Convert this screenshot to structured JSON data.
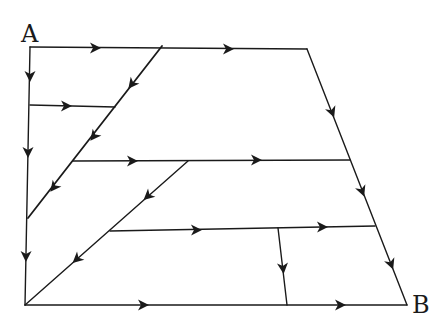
{
  "diagram": {
    "title": "",
    "nodes": {
      "source": {
        "label": "A"
      },
      "sink": {
        "label": "B"
      }
    },
    "edges": [
      {
        "id": "top-edge",
        "description": "A to top-right corner",
        "direction": "right",
        "arrow_count": 2
      },
      {
        "id": "left-edge",
        "description": "A down to bottom-left corner",
        "direction": "down",
        "arrow_count": 3
      },
      {
        "id": "right-edge",
        "description": "top-right corner down to B",
        "direction": "down-right",
        "arrow_count": 3
      },
      {
        "id": "bottom-edge",
        "description": "bottom-left corner to B",
        "direction": "right",
        "arrow_count": 2
      },
      {
        "id": "upper-diagonal",
        "description": "top edge down-left to left edge",
        "direction": "down-left",
        "arrow_count": 2
      },
      {
        "id": "upper-crossbar",
        "description": "left edge to upper diagonal",
        "direction": "right",
        "arrow_count": 1
      },
      {
        "id": "middle-crossbar",
        "description": "upper diagonal to right edge",
        "direction": "right",
        "arrow_count": 2
      },
      {
        "id": "lower-diagonal",
        "description": "middle crossbar down-left to bottom-left corner",
        "direction": "down-left",
        "arrow_count": 2
      },
      {
        "id": "lower-crossbar",
        "description": "lower diagonal to right edge",
        "direction": "right",
        "arrow_count": 2
      },
      {
        "id": "vertical-connector",
        "description": "lower crossbar down to bottom edge",
        "direction": "down",
        "arrow_count": 1
      }
    ]
  }
}
